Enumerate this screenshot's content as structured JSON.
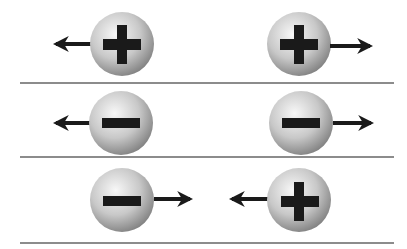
{
  "diagram": {
    "rows": [
      {
        "name": "positive-positive",
        "left": {
          "charge": "+",
          "arrow": "left"
        },
        "right": {
          "charge": "+",
          "arrow": "right"
        },
        "interaction": "repel"
      },
      {
        "name": "negative-negative",
        "left": {
          "charge": "-",
          "arrow": "left"
        },
        "right": {
          "charge": "-",
          "arrow": "right"
        },
        "interaction": "repel"
      },
      {
        "name": "negative-positive",
        "left": {
          "charge": "-",
          "arrow": "right"
        },
        "right": {
          "charge": "+",
          "arrow": "left"
        },
        "interaction": "attract"
      }
    ],
    "colors": {
      "sphere_light": "#f4f4f4",
      "sphere_dark": "#8a8a8a",
      "symbol": "#1a1a1a",
      "divider": "#8c8c8c"
    }
  }
}
